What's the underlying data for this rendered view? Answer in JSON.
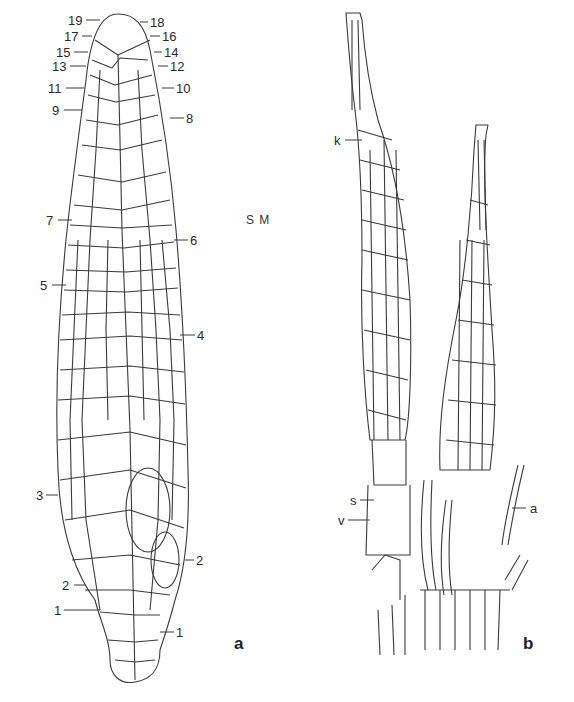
{
  "figure": {
    "marker": "S M",
    "panel_a": {
      "label": "a",
      "subject": "apical cell lineage / shoot tip with numbered cell segments",
      "left_labels": [
        "19",
        "17",
        "15",
        "13",
        "11",
        "9",
        "7",
        "5",
        "3",
        "2",
        "1"
      ],
      "right_labels": [
        "18",
        "16",
        "14",
        "12",
        "10",
        "8",
        "6",
        "4",
        "2",
        "1"
      ]
    },
    "panel_b": {
      "label": "b",
      "subject": "sporophytes with calyptra",
      "labels": {
        "k": "k",
        "s": "s",
        "v": "v",
        "a": "a"
      }
    }
  },
  "colors": {
    "line": "#3a3a3a",
    "background": "#ffffff"
  }
}
